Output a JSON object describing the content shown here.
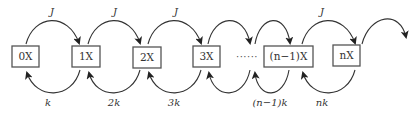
{
  "diagram": {
    "type": "birth-death chain",
    "states": [
      {
        "id": "s0",
        "label": "0X"
      },
      {
        "id": "s1",
        "label": "1X"
      },
      {
        "id": "s2",
        "label": "2X"
      },
      {
        "id": "s3",
        "label": "3X"
      },
      {
        "id": "sn1",
        "label": "(n−1)X"
      },
      {
        "id": "sn",
        "label": "nX"
      }
    ],
    "ellipsis": "······",
    "forward_rates": [
      {
        "from": "0X",
        "to": "1X",
        "label": "J"
      },
      {
        "from": "1X",
        "to": "2X",
        "label": "J"
      },
      {
        "from": "2X",
        "to": "3X",
        "label": "J"
      },
      {
        "from": "(n−1)X",
        "to": "nX",
        "label": "J"
      }
    ],
    "backward_rates": [
      {
        "from": "1X",
        "to": "0X",
        "label": "k"
      },
      {
        "from": "2X",
        "to": "1X",
        "label": "2k"
      },
      {
        "from": "3X",
        "to": "2X",
        "label": "3k"
      },
      {
        "from": "(n−1)X",
        "to": "…",
        "label": "(n−1)k"
      },
      {
        "from": "nX",
        "to": "(n−1)X",
        "label": "nk"
      }
    ]
  }
}
